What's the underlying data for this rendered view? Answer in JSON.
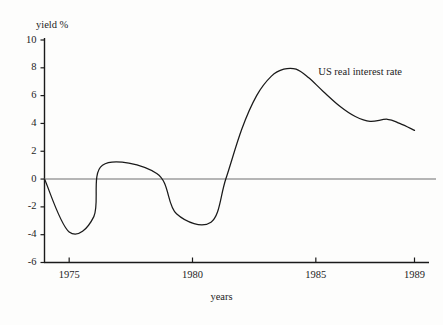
{
  "chart_data": {
    "type": "line",
    "title": "",
    "xlabel": "years",
    "ylabel": "yield %",
    "xlim": [
      1974,
      1989
    ],
    "ylim": [
      -6,
      10
    ],
    "grid": false,
    "legend_position": "inline-annotation",
    "annotations": [
      {
        "text": "US real interest rate",
        "x": 1985.1,
        "y": 7.6
      }
    ],
    "zero_line": true,
    "y_ticks": [
      10,
      8,
      6,
      4,
      2,
      0,
      -2,
      -4,
      -6
    ],
    "y_tick_labels": [
      "10",
      "8",
      "6",
      "4",
      "2",
      "0",
      "-2",
      "-4",
      "-6"
    ],
    "x_ticks": [
      1975,
      1980,
      1985,
      1989
    ],
    "x_tick_labels": [
      "1975",
      "1980",
      "1985",
      "1989"
    ],
    "series": [
      {
        "name": "US real interest rate",
        "color": "#1a1a1a",
        "x": [
          1974.0,
          1975.0,
          1976.0,
          1976.35,
          1978.55,
          1979.35,
          1980.75,
          1981.35,
          1982.0,
          1982.6,
          1983.2,
          1983.7,
          1984.2,
          1984.7,
          1985.3,
          1986.0,
          1986.6,
          1987.2,
          1987.9,
          1988.4,
          1989.0
        ],
        "y": [
          0.0,
          -3.8,
          -2.7,
          1.0,
          0.4,
          -2.5,
          -3.1,
          0.0,
          3.6,
          6.0,
          7.4,
          7.9,
          7.9,
          7.3,
          6.3,
          5.2,
          4.5,
          4.15,
          4.3,
          4.0,
          3.5
        ]
      }
    ]
  },
  "axis": {
    "ylabel_text": "yield %",
    "xlabel_text": "years"
  },
  "colors": {
    "line": "#1a1a1a",
    "axis": "#1a1a1a",
    "zero_line": "#6e6e6e",
    "background": "#fdfdfc"
  }
}
